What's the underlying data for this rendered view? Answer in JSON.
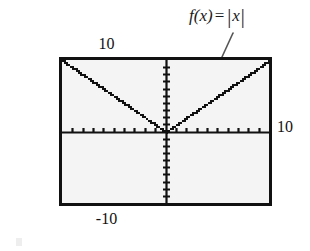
{
  "figure": {
    "kind": "graphing-calculator-screen",
    "background_color": "#ffffff",
    "screen_fill_color": "#f4f4f4",
    "frame_color": "#111111",
    "ink_color": "#111111",
    "annotation_color": "#555555",
    "scan_mark_color": "#eeeeee"
  },
  "annotation": {
    "fn_name": "f",
    "open_paren": "(",
    "variable": "x",
    "close_paren": ")",
    "equals": "=",
    "abs_open": "|",
    "abs_arg": "x",
    "abs_close": "|",
    "full_text": "f(x) = |x|"
  },
  "axis_labels": {
    "top": "10",
    "bottom": "-10",
    "left": "-10",
    "right": "10"
  },
  "chart_data": {
    "type": "line",
    "title": "",
    "subtitle": "",
    "xlabel": "",
    "ylabel": "",
    "equation": "f(x) = |x|",
    "xlim": [
      -10,
      10
    ],
    "ylim": [
      -10,
      10
    ],
    "xticks": [
      -9,
      -8,
      -7,
      -6,
      -5,
      -4,
      -3,
      -2,
      -1,
      0,
      1,
      2,
      3,
      4,
      5,
      6,
      7,
      8,
      9
    ],
    "yticks": [
      -9,
      -8,
      -7,
      -6,
      -5,
      -4,
      -3,
      -2,
      -1,
      0,
      1,
      2,
      3,
      4,
      5,
      6,
      7,
      8,
      9
    ],
    "tick_spacing": 1,
    "grid": false,
    "legend": "none",
    "axes_visible": true,
    "x_tick_labels": [
      "-10",
      "10"
    ],
    "y_tick_labels": [
      "-10",
      "10"
    ],
    "series": [
      {
        "name": "f(x) = |x|",
        "style": "pixelated-solid",
        "color": "#111111",
        "x": [
          -10,
          -9,
          -8,
          -7,
          -6,
          -5,
          -4,
          -3,
          -2,
          -1,
          0,
          1,
          2,
          3,
          4,
          5,
          6,
          7,
          8,
          9,
          10
        ],
        "y": [
          10,
          9,
          8,
          7,
          6,
          5,
          4,
          3,
          2,
          1,
          0,
          1,
          2,
          3,
          4,
          5,
          6,
          7,
          8,
          9,
          10
        ]
      }
    ],
    "annotations": [
      {
        "text": "f(x) = |x|",
        "points_to_x": 3.2,
        "points_to_y": 3.2,
        "arrow": true
      }
    ]
  }
}
